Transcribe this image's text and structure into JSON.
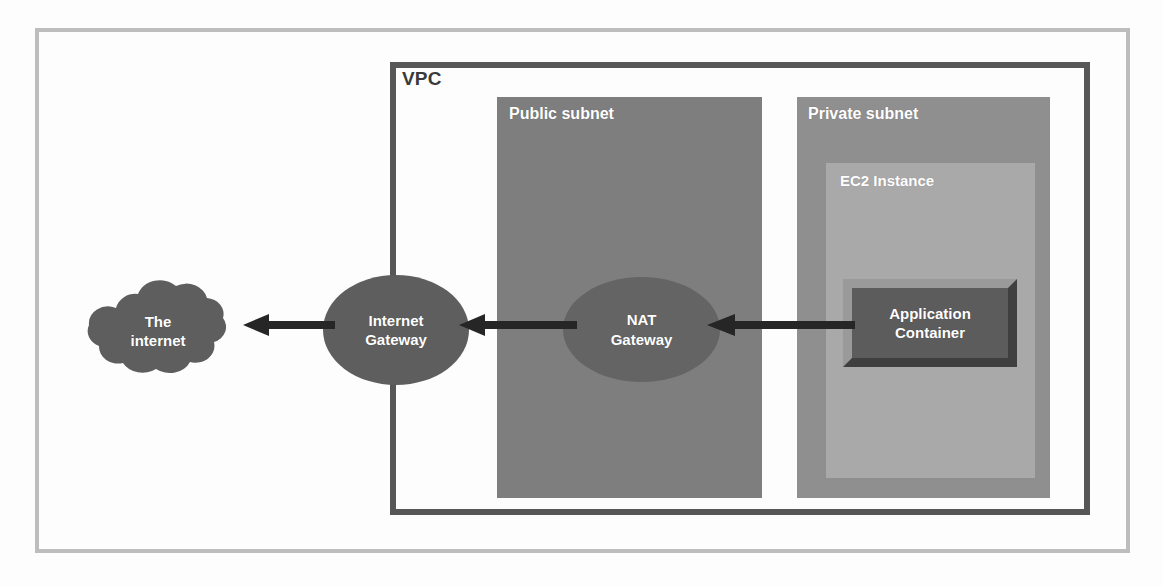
{
  "diagram": {
    "outer_frame": {
      "name": "diagram-frame",
      "border_color": "#bdbdbd"
    },
    "vpc": {
      "label": "VPC",
      "border_color": "#575757",
      "label_color": "#3a3a3a"
    },
    "subnets": [
      {
        "id": "public-subnet",
        "label": "Public subnet",
        "fill": "#7e7e7e",
        "label_color": "#ffffff"
      },
      {
        "id": "private-subnet",
        "label": "Private subnet",
        "fill": "#8f8f8f",
        "label_color": "#ffffff"
      }
    ],
    "ec2_instance": {
      "label": "EC2 Instance",
      "fill": "#a9a9a9",
      "label_color": "#ffffff"
    },
    "app_container": {
      "label": "Application\nContainer",
      "fill": "#5c5c5c",
      "bevel_light": "#9a9a9a",
      "bevel_dark": "#3f3f3f",
      "label_color": "#ffffff"
    },
    "nodes": [
      {
        "id": "internet-cloud",
        "label": "The\ninternet",
        "shape": "cloud",
        "fill": "#5e5e5e",
        "label_color": "#ffffff"
      },
      {
        "id": "internet-gateway",
        "label": "Internet\nGateway",
        "shape": "ellipse",
        "fill": "#5e5e5e",
        "label_color": "#ffffff"
      },
      {
        "id": "nat-gateway",
        "label": "NAT\nGateway",
        "shape": "ellipse",
        "fill": "#646464",
        "label_color": "#ffffff"
      }
    ],
    "arrows": [
      {
        "id": "arrow-igw-to-internet",
        "from": "Internet Gateway",
        "to": "The internet",
        "direction": "left",
        "color": "#262626"
      },
      {
        "id": "arrow-nat-to-igw",
        "from": "NAT Gateway",
        "to": "Internet Gateway",
        "direction": "left",
        "color": "#262626"
      },
      {
        "id": "arrow-app-to-nat",
        "from": "Application Container",
        "to": "NAT Gateway",
        "direction": "left",
        "color": "#262626"
      }
    ]
  }
}
